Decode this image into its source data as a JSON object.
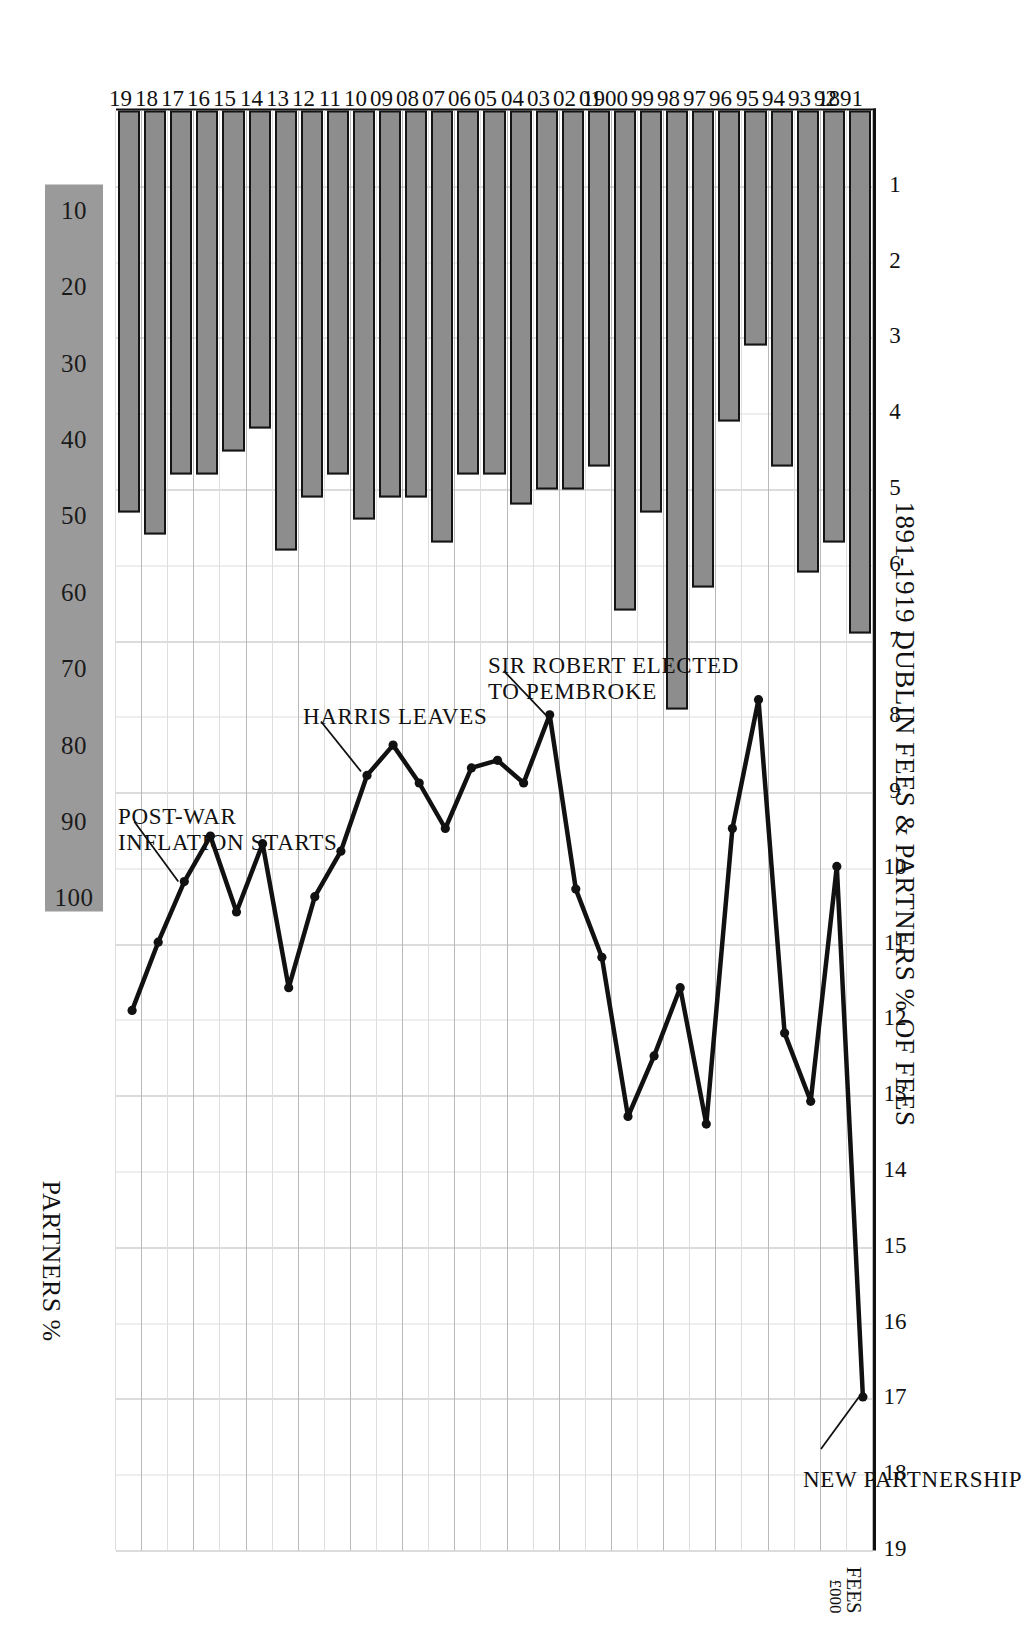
{
  "title": "1891-1919 DUBLIN FEES & PARTNERS % OF FEES",
  "axes": {
    "fees_label_line1": "FEES",
    "fees_label_line2": "£000",
    "partners_label": "PARTNERS %"
  },
  "annotations": [
    {
      "name": "new-partnership",
      "text": "NEW PARTNERSHIP"
    },
    {
      "name": "sir-robert-elected",
      "text": "SIR ROBERT ELECTED\nTO PEMBROKE"
    },
    {
      "name": "harris-leaves",
      "text": "HARRIS LEAVES"
    },
    {
      "name": "post-war-inflation",
      "text": "POST-WAR\nINFLATION STARTS"
    }
  ],
  "colors": {
    "bar_fill": "#8d8d8d",
    "bar_stroke": "#141414",
    "line": "#111111",
    "grid": "#b9b9b9",
    "band": "#9a9a9a",
    "paper": "#ffffff"
  },
  "chart_data": {
    "type": "bar",
    "title": "1891-1919 DUBLIN FEES & PARTNERS % OF FEES",
    "xlabel": "FEES £000",
    "ylabel": "",
    "orientation": "horizontal",
    "grid": true,
    "legend": "none",
    "categories": [
      "1891",
      "92",
      "93",
      "94",
      "95",
      "96",
      "97",
      "98",
      "99",
      "1900",
      "01",
      "02",
      "03",
      "04",
      "05",
      "06",
      "07",
      "08",
      "09",
      "10",
      "11",
      "12",
      "13",
      "14",
      "15",
      "16",
      "17",
      "18",
      "19"
    ],
    "xlim": [
      0,
      19
    ],
    "xticks": [
      1,
      2,
      3,
      4,
      5,
      6,
      7,
      8,
      9,
      10,
      11,
      12,
      13,
      14,
      15,
      16,
      17,
      18,
      19
    ],
    "series": [
      {
        "name": "Fees £000",
        "axis": "fees",
        "type": "bar",
        "values": [
          6.9,
          5.7,
          6.1,
          4.7,
          3.1,
          4.1,
          6.3,
          7.9,
          5.3,
          6.6,
          4.7,
          5.0,
          5.0,
          5.2,
          4.8,
          4.8,
          5.7,
          5.1,
          5.1,
          5.4,
          4.8,
          5.1,
          5.8,
          4.2,
          4.5,
          4.8,
          4.8,
          5.6,
          5.3
        ]
      },
      {
        "name": "Partners % of fees",
        "axis": "partners",
        "type": "line",
        "marker": "dot",
        "values": [
          17.0,
          10.0,
          13.1,
          12.2,
          7.8,
          9.5,
          13.4,
          11.6,
          12.5,
          13.3,
          11.2,
          10.3,
          8.0,
          8.9,
          8.6,
          8.7,
          9.5,
          8.9,
          8.4,
          8.8,
          9.8,
          10.4,
          11.6,
          9.7,
          10.6,
          9.6,
          10.2,
          11.0,
          11.9
        ]
      }
    ],
    "partners_axis": {
      "label": "PARTNERS %",
      "ticks": [
        10,
        20,
        30,
        40,
        50,
        60,
        70,
        80,
        90,
        100
      ],
      "lim": [
        0,
        100
      ],
      "note": "Partners % scale is drawn over the same plot width as the fees scale; 100% aligns with fees £19,000."
    }
  }
}
